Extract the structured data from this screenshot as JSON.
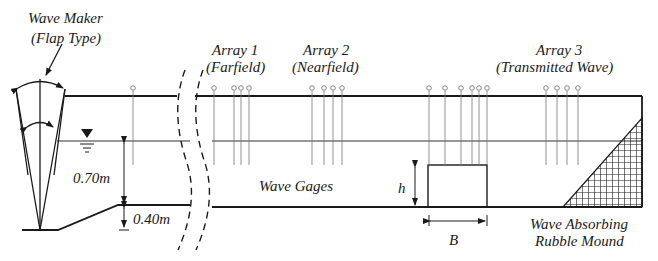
{
  "diagram": {
    "type": "wave flume experimental setup",
    "labels": {
      "wave_maker_line1": "Wave Maker",
      "wave_maker_line2": "(Flap Type)",
      "array1_line1": "Array 1",
      "array1_line2": "(Farfield)",
      "array2_line1": "Array 2",
      "array2_line2": "(Nearfield)",
      "array3_line1": "Array 3",
      "array3_line2": "(Transmitted Wave)",
      "wave_gages": "Wave Gages",
      "water_depth": "0.70m",
      "step_height": "0.40m",
      "structure_height": "h",
      "structure_width": "B",
      "absorber_line1": "Wave Absorbing",
      "absorber_line2": "Rubble Mound"
    },
    "gages": {
      "isolated_x": [
        133
      ],
      "array1_x": [
        214,
        234,
        241,
        249
      ],
      "array2_x": [
        312,
        324,
        333,
        342
      ],
      "structure_group_x": [
        429,
        445,
        461,
        472,
        479,
        487
      ],
      "array3_x": [
        546,
        557,
        567,
        578
      ]
    },
    "colors": {
      "line": "#1a1a1a",
      "gage": "#777777",
      "background": "#ffffff"
    }
  }
}
